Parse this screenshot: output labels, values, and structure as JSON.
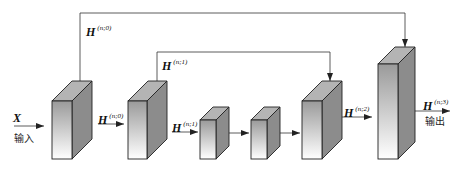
{
  "diagram": {
    "input": {
      "var": "X",
      "label": "输入"
    },
    "output": {
      "var": "H",
      "sup": "(n;3)",
      "label": "输出"
    },
    "edge_labels": [
      {
        "id": "h_n0_skip",
        "var": "H",
        "sup": "(n;0)"
      },
      {
        "id": "h_n0",
        "var": "H",
        "sup": "(n;0)"
      },
      {
        "id": "h_n1_skip",
        "var": "H",
        "sup": "(n;1)"
      },
      {
        "id": "h_n1",
        "var": "H",
        "sup": "(n;1)"
      },
      {
        "id": "h_n2",
        "var": "H",
        "sup": "(n;2)"
      }
    ],
    "blocks": [
      {
        "id": "block-1",
        "x": 52,
        "y": 101,
        "w": 20,
        "h": 58,
        "dx": 20,
        "dy": 20
      },
      {
        "id": "block-2",
        "x": 128,
        "y": 101,
        "w": 19,
        "h": 58,
        "dx": 20,
        "dy": 20
      },
      {
        "id": "block-3",
        "x": 200,
        "y": 120,
        "w": 16,
        "h": 39,
        "dx": 13,
        "dy": 13
      },
      {
        "id": "block-4",
        "x": 251,
        "y": 120,
        "w": 16,
        "h": 39,
        "dx": 13,
        "dy": 13
      },
      {
        "id": "block-5",
        "x": 302,
        "y": 101,
        "w": 20,
        "h": 58,
        "dx": 20,
        "dy": 20
      },
      {
        "id": "block-6",
        "x": 378,
        "y": 64,
        "w": 20,
        "h": 95,
        "dx": 17,
        "dy": 17
      }
    ],
    "colors": {
      "front_top": "#9a9a9a",
      "front_bottom": "#ffffff",
      "side": "#8c8c8c",
      "top": "#b4b4b4",
      "stroke": "#222222"
    }
  }
}
